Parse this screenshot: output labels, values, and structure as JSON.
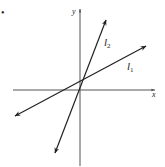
{
  "diagram": {
    "type": "coordinate-plane",
    "axes": {
      "x_label": "x",
      "y_label": "y"
    },
    "lines": [
      {
        "id": "l1",
        "label_base": "l",
        "label_sub": "1",
        "description": "line with smaller positive slope"
      },
      {
        "id": "l2",
        "label_base": "l",
        "label_sub": "2",
        "description": "line with larger positive slope"
      }
    ],
    "marker": "•",
    "colors": {
      "axis": "#555555",
      "line": "#222222",
      "background": "#ffffff"
    }
  }
}
